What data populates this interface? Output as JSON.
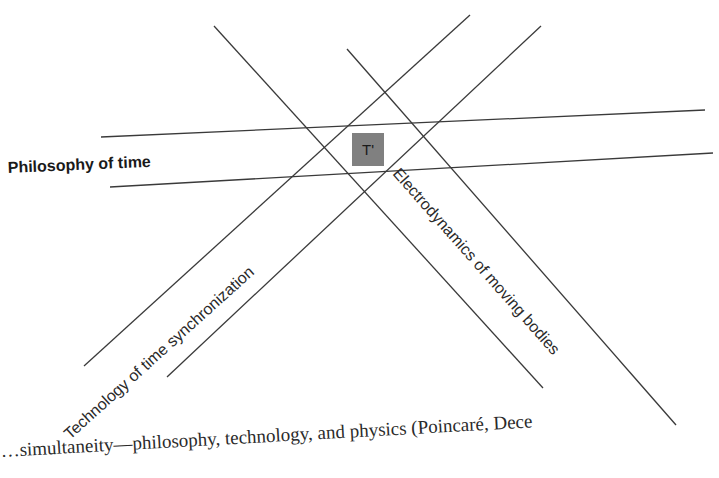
{
  "diagram": {
    "labels": {
      "philosophy": "Philosophy of time",
      "technology": "Technology of time synchronization",
      "electrodynamics": "Electrodynamics of moving bodies",
      "intersection": "T'"
    },
    "colors": {
      "line": "#3a3a3a",
      "intersection_box": "#808080",
      "text": "#1a1a1a"
    }
  },
  "caption": {
    "text": "…simultaneity—philosophy, technology, and physics (Poincaré, Dece"
  }
}
